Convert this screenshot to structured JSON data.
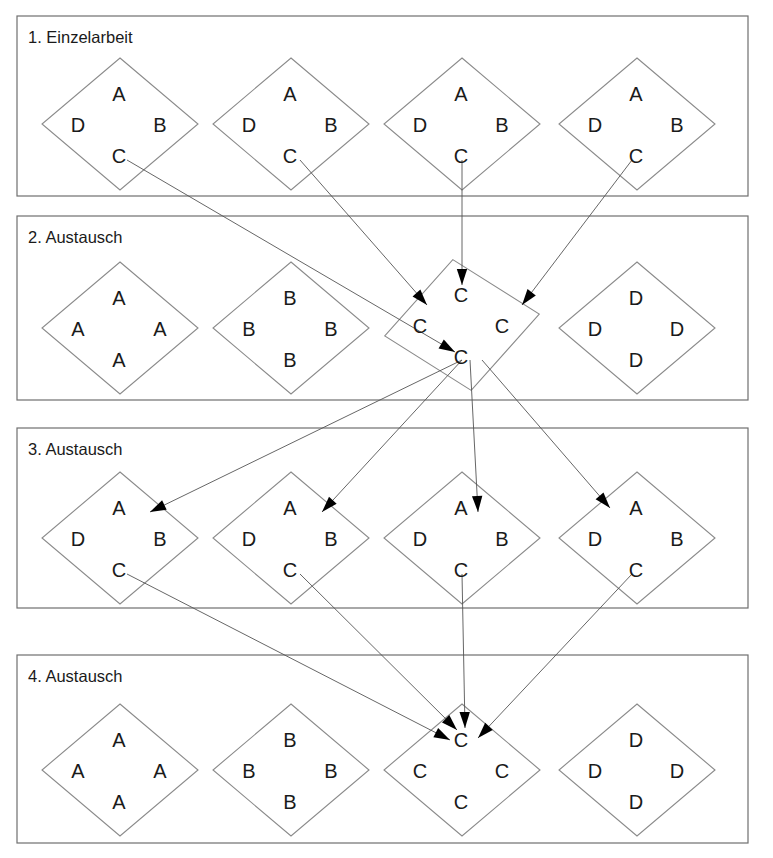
{
  "diagram": {
    "title_text_language": "de",
    "frames": [
      {
        "id": "frame-1",
        "label": "1. Einzelarbeit",
        "x": 17,
        "y": 16,
        "w": 731,
        "h": 180,
        "groups": [
          {
            "id": "g1-1",
            "cx": 120,
            "cy": 124,
            "rx": 78,
            "ry": 66,
            "rot": 0,
            "labels": {
              "top": "A",
              "right": "B",
              "bottom": "C",
              "left": "D"
            }
          },
          {
            "id": "g1-2",
            "cx": 291,
            "cy": 124,
            "rx": 78,
            "ry": 66,
            "rot": 0,
            "labels": {
              "top": "A",
              "right": "B",
              "bottom": "C",
              "left": "D"
            }
          },
          {
            "id": "g1-3",
            "cx": 462,
            "cy": 124,
            "rx": 78,
            "ry": 66,
            "rot": 0,
            "labels": {
              "top": "A",
              "right": "B",
              "bottom": "C",
              "left": "D"
            }
          },
          {
            "id": "g1-4",
            "cx": 637,
            "cy": 124,
            "rx": 78,
            "ry": 66,
            "rot": 0,
            "labels": {
              "top": "A",
              "right": "B",
              "bottom": "C",
              "left": "D"
            }
          }
        ]
      },
      {
        "id": "frame-2",
        "label": "2. Austausch",
        "x": 17,
        "y": 216,
        "w": 731,
        "h": 184,
        "groups": [
          {
            "id": "g2-1",
            "cx": 120,
            "cy": 328,
            "rx": 78,
            "ry": 66,
            "rot": 0,
            "labels": {
              "top": "A",
              "right": "A",
              "bottom": "A",
              "left": "A"
            }
          },
          {
            "id": "g2-2",
            "cx": 291,
            "cy": 328,
            "rx": 78,
            "ry": 66,
            "rot": 0,
            "labels": {
              "top": "B",
              "right": "B",
              "bottom": "B",
              "left": "B"
            }
          },
          {
            "id": "g2-3",
            "cx": 462,
            "cy": 325,
            "rx": 78,
            "ry": 66,
            "rot": -8,
            "labels": {
              "top": "C",
              "right": "C",
              "bottom": "C",
              "left": "C"
            }
          },
          {
            "id": "g2-4",
            "cx": 637,
            "cy": 328,
            "rx": 78,
            "ry": 66,
            "rot": 0,
            "labels": {
              "top": "D",
              "right": "D",
              "bottom": "D",
              "left": "D"
            }
          }
        ]
      },
      {
        "id": "frame-3",
        "label": "3. Austausch",
        "x": 17,
        "y": 428,
        "w": 731,
        "h": 180,
        "groups": [
          {
            "id": "g3-1",
            "cx": 120,
            "cy": 538,
            "rx": 78,
            "ry": 66,
            "rot": 0,
            "labels": {
              "top": "A",
              "right": "B",
              "bottom": "C",
              "left": "D"
            }
          },
          {
            "id": "g3-2",
            "cx": 291,
            "cy": 538,
            "rx": 78,
            "ry": 66,
            "rot": 0,
            "labels": {
              "top": "A",
              "right": "B",
              "bottom": "C",
              "left": "D"
            }
          },
          {
            "id": "g3-3",
            "cx": 462,
            "cy": 538,
            "rx": 78,
            "ry": 66,
            "rot": 0,
            "labels": {
              "top": "A",
              "right": "B",
              "bottom": "C",
              "left": "D"
            }
          },
          {
            "id": "g3-4",
            "cx": 637,
            "cy": 538,
            "rx": 78,
            "ry": 66,
            "rot": 0,
            "labels": {
              "top": "A",
              "right": "B",
              "bottom": "C",
              "left": "D"
            }
          }
        ]
      },
      {
        "id": "frame-4",
        "label": "4. Austausch",
        "x": 17,
        "y": 655,
        "w": 731,
        "h": 188,
        "groups": [
          {
            "id": "g4-1",
            "cx": 120,
            "cy": 770,
            "rx": 78,
            "ry": 66,
            "rot": 0,
            "labels": {
              "top": "A",
              "right": "A",
              "bottom": "A",
              "left": "A"
            }
          },
          {
            "id": "g4-2",
            "cx": 291,
            "cy": 770,
            "rx": 78,
            "ry": 66,
            "rot": 0,
            "labels": {
              "top": "B",
              "right": "B",
              "bottom": "B",
              "left": "B"
            }
          },
          {
            "id": "g4-3",
            "cx": 462,
            "cy": 770,
            "rx": 78,
            "ry": 66,
            "rot": 0,
            "labels": {
              "top": "C",
              "right": "C",
              "bottom": "C",
              "left": "C"
            }
          },
          {
            "id": "g4-4",
            "cx": 637,
            "cy": 770,
            "rx": 78,
            "ry": 66,
            "rot": 0,
            "labels": {
              "top": "D",
              "right": "D",
              "bottom": "D",
              "left": "D"
            }
          }
        ]
      }
    ],
    "connections": [
      {
        "id": "c1-1",
        "from": "frame1-group1-C",
        "to": "frame2-group3-C-bottom",
        "x1": 127,
        "y1": 160,
        "x2": 455,
        "y2": 352,
        "head": 1
      },
      {
        "id": "c1-2",
        "from": "frame1-group2-C",
        "to": "frame2-group3-C-left",
        "x1": 300,
        "y1": 160,
        "x2": 427,
        "y2": 305,
        "head": 1
      },
      {
        "id": "c1-3",
        "from": "frame1-group3-C",
        "to": "frame2-group3-C-top",
        "x1": 462,
        "y1": 160,
        "x2": 462,
        "y2": 285,
        "head": 1
      },
      {
        "id": "c1-4",
        "from": "frame1-group4-C",
        "to": "frame2-group3-C-right",
        "x1": 632,
        "y1": 160,
        "x2": 522,
        "y2": 305,
        "head": 1
      },
      {
        "id": "c2-1",
        "from": "frame2-group3-C-bottom",
        "to": "frame3-group1-A",
        "x1": 462,
        "y1": 360,
        "x2": 150,
        "y2": 512,
        "head": 1
      },
      {
        "id": "c2-2",
        "from": "frame2-group3-C-bottom",
        "to": "frame3-group2-A",
        "x1": 462,
        "y1": 360,
        "x2": 322,
        "y2": 512,
        "head": 1
      },
      {
        "id": "c2-3",
        "from": "frame2-group3-C-bottom",
        "to": "frame3-group3-A",
        "x1": 470,
        "y1": 360,
        "x2": 478,
        "y2": 512,
        "head": 1
      },
      {
        "id": "c2-4",
        "from": "frame2-group3-C-bottom",
        "to": "frame3-group4-A",
        "x1": 482,
        "y1": 360,
        "x2": 610,
        "y2": 508,
        "head": 1
      },
      {
        "id": "c3-1",
        "from": "frame3-group1-C",
        "to": "frame4-group3-C-top",
        "x1": 127,
        "y1": 574,
        "x2": 450,
        "y2": 740,
        "head": 1
      },
      {
        "id": "c3-2",
        "from": "frame3-group2-C",
        "to": "frame4-group3-C-top",
        "x1": 300,
        "y1": 574,
        "x2": 457,
        "y2": 730,
        "head": 1
      },
      {
        "id": "c3-3",
        "from": "frame3-group3-C",
        "to": "frame4-group3-C-top",
        "x1": 462,
        "y1": 574,
        "x2": 465,
        "y2": 728,
        "head": 1
      },
      {
        "id": "c3-4",
        "from": "frame3-group4-C",
        "to": "frame4-group3-C-top",
        "x1": 632,
        "y1": 574,
        "x2": 478,
        "y2": 738,
        "head": 1
      }
    ]
  },
  "meta": {
    "stroke_color": "#6f6f6f",
    "diamond_stroke_color": "#8a8a8a",
    "text_color": "#1a1a1a",
    "arrow_color": "#000000",
    "background": "#ffffff"
  }
}
